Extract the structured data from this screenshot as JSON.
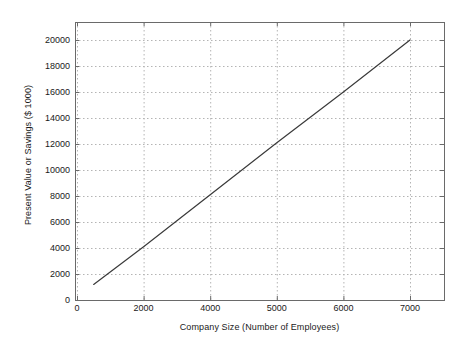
{
  "chart_data": {
    "type": "line",
    "title": "",
    "xlabel": "Company Size (Number of Employees)",
    "ylabel": "Present Value or Savings ($ 1000)",
    "xtick_labels": [
      "0",
      "2000",
      "4000",
      "5000",
      "6000",
      "7000"
    ],
    "ytick_labels": [
      "0",
      "2000",
      "4000",
      "6000",
      "8000",
      "10000",
      "12000",
      "14000",
      "16000",
      "18000",
      "20000"
    ],
    "xtick_values": [
      0,
      2000,
      4000,
      5000,
      6000,
      7000
    ],
    "ytick_values": [
      0,
      2000,
      4000,
      6000,
      8000,
      10000,
      12000,
      14000,
      16000,
      18000,
      20000
    ],
    "ylim": [
      0,
      21000
    ],
    "grid": true,
    "grid_style": "dashed",
    "grid_color": "#b4b4b4",
    "legend": "none",
    "series": [
      {
        "name": "Present Value or Savings",
        "color": "#3a3a3a",
        "x": [
          500,
          2000,
          3000,
          4000,
          5000,
          6000,
          7000
        ],
        "values": [
          1200,
          4100,
          6100,
          8100,
          12100,
          16000,
          20000
        ]
      }
    ]
  },
  "axes": {
    "xlabel": "Company Size (Number of Employees)",
    "ylabel": "Present Value or Savings ($ 1000)"
  },
  "ticks": {
    "x": [
      {
        "label": "0"
      },
      {
        "label": "2000"
      },
      {
        "label": "4000"
      },
      {
        "label": "5000"
      },
      {
        "label": "6000"
      },
      {
        "label": "7000"
      }
    ],
    "y": [
      {
        "label": "0"
      },
      {
        "label": "2000"
      },
      {
        "label": "4000"
      },
      {
        "label": "6000"
      },
      {
        "label": "8000"
      },
      {
        "label": "10000"
      },
      {
        "label": "12000"
      },
      {
        "label": "14000"
      },
      {
        "label": "16000"
      },
      {
        "label": "18000"
      },
      {
        "label": "20000"
      }
    ]
  },
  "colors": {
    "line": "#3a3a3a",
    "grid": "#b4b4b4",
    "frame": "#6a6a6a",
    "text": "#1a1a1a"
  }
}
